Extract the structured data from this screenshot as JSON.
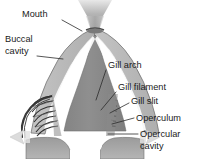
{
  "figure": {
    "background_color": "#ffffff"
  },
  "colors": {
    "body_fill": "#8c8c8c",
    "body_fill_dark": "#7d7d7d",
    "cavity_band": "#b8b8b8",
    "cavity_band_light": "#c9c9c9",
    "outline": "#4a4a4a",
    "filament_dark": "#2e2e2e",
    "arrow_light": "#dcdcdc",
    "funnel_top": "#e6e6e6",
    "funnel_mid": "#a8a8a8",
    "text_color": "#1a1a1a",
    "leader_color": "#2b2b2b"
  },
  "labels": [
    {
      "id": "mouth",
      "name": "mouth",
      "text": "Mouth",
      "text_x": 22,
      "text_y": 17,
      "anchor": "start",
      "leader": "M 62 20 L 82 31"
    },
    {
      "id": "buccal-cavity",
      "name": "buccal-cavity",
      "text_lines": [
        "Buccal",
        "cavity"
      ],
      "text_x": 5,
      "text_y": 42,
      "anchor": "start",
      "leader": "M 37 56 L 63 59"
    },
    {
      "id": "gill-arch",
      "name": "gill-arch",
      "text": "Gill arch",
      "text_x": 108,
      "text_y": 68,
      "anchor": "start",
      "leader": "M 106 70 L 96 100"
    },
    {
      "id": "gill-filament",
      "name": "gill-filament",
      "text": "Gill filament",
      "text_x": 118,
      "text_y": 90,
      "anchor": "start",
      "leader": "M 116 92 L 101 110"
    },
    {
      "id": "gill-slit",
      "name": "gill-slit",
      "text": "Gill slit",
      "text_x": 131,
      "text_y": 104,
      "anchor": "start",
      "leader": "M 129 103 L 110 113"
    },
    {
      "id": "operculum",
      "name": "operculum",
      "text": "Operculum",
      "text_x": 136,
      "text_y": 121,
      "anchor": "start",
      "leader": "M 134 118 L 112 124"
    },
    {
      "id": "opercular-cavity",
      "name": "opercular-cavity",
      "text_lines": [
        "Opercular",
        "cavity"
      ],
      "text_x": 140,
      "text_y": 137,
      "anchor": "start",
      "leader": "M 138 134 L 108 134"
    }
  ],
  "structures": [
    {
      "name": "mouth-funnel",
      "description": "Flared water-intake funnel above the mouth"
    },
    {
      "name": "buccal-cavity-left-wall",
      "description": "Left curved band forming buccal cavity wall"
    },
    {
      "name": "buccal-cavity-right-wall",
      "description": "Right curved band forming buccal cavity wall"
    },
    {
      "name": "central-body",
      "description": "Central wedge-shaped body mass"
    },
    {
      "name": "gill-filaments-left",
      "description": "Left set of comb-like gill filaments"
    },
    {
      "name": "gill-filaments-right",
      "description": "Right set of comb-like gill filaments"
    },
    {
      "name": "operculum-left-flap",
      "description": "Left operculum flap"
    },
    {
      "name": "operculum-right-flap",
      "description": "Right operculum flap"
    },
    {
      "name": "outflow-arrow-left",
      "description": "Left water outflow arrow"
    },
    {
      "name": "outflow-arrow-right",
      "description": "Right water outflow arrow"
    }
  ]
}
